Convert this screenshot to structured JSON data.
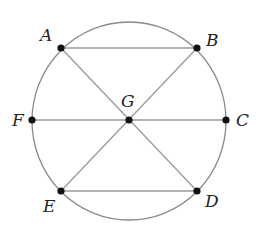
{
  "diagram": {
    "circle": {
      "cx": 129,
      "cy": 121,
      "rx": 97,
      "ry": 99,
      "stroke": "#8a8a8a"
    },
    "line_color": "#9a9a9a",
    "point_color": "#111111",
    "points": [
      {
        "id": "A",
        "label": "A",
        "x": 61,
        "y": 48,
        "lx": 40,
        "ly": 27
      },
      {
        "id": "B",
        "label": "B",
        "x": 197,
        "y": 48,
        "lx": 206,
        "ly": 32
      },
      {
        "id": "C",
        "label": "C",
        "x": 226,
        "y": 120,
        "lx": 236,
        "ly": 112
      },
      {
        "id": "D",
        "label": "D",
        "x": 197,
        "y": 191,
        "lx": 205,
        "ly": 193
      },
      {
        "id": "E",
        "label": "E",
        "x": 61,
        "y": 191,
        "lx": 43,
        "ly": 198
      },
      {
        "id": "F",
        "label": "F",
        "x": 32,
        "y": 120,
        "lx": 12,
        "ly": 112
      },
      {
        "id": "G",
        "label": "G",
        "x": 129,
        "y": 120,
        "lx": 121,
        "ly": 93
      }
    ],
    "segments": [
      [
        "A",
        "B"
      ],
      [
        "E",
        "D"
      ],
      [
        "F",
        "C"
      ],
      [
        "A",
        "D"
      ],
      [
        "B",
        "E"
      ]
    ]
  }
}
